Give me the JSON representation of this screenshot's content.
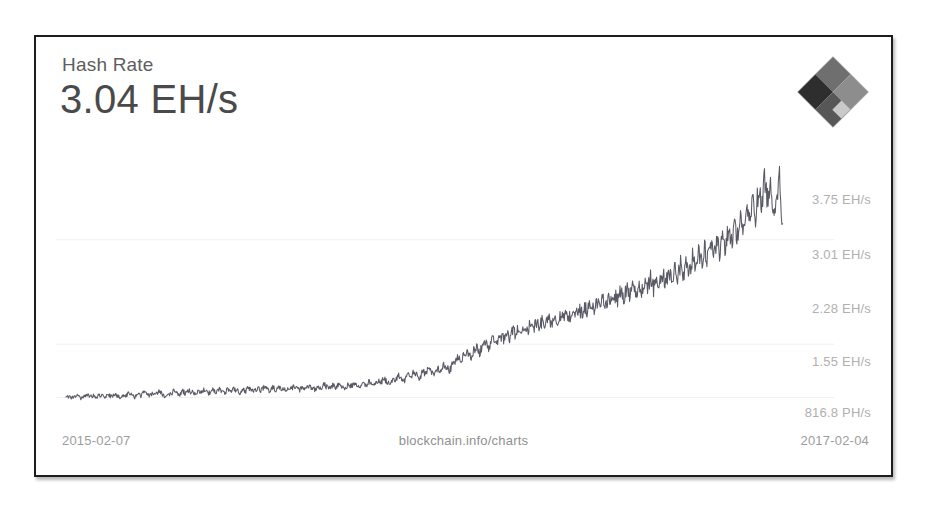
{
  "card": {
    "title": "Hash Rate",
    "value": "3.04 EH/s",
    "logo_icon": "blockchain-diamond-logo-icon",
    "border_color": "#1d1d1d",
    "background": "#ffffff"
  },
  "axis": {
    "y_labels": [
      {
        "text": "3.75 EH/s",
        "y_px": 51
      },
      {
        "text": "3.01 EH/s",
        "y_px": 106
      },
      {
        "text": "2.28 EH/s",
        "y_px": 160
      },
      {
        "text": "1.55 EH/s",
        "y_px": 213
      },
      {
        "text": "816.8 PH/s",
        "y_px": 264
      }
    ],
    "y_label_color": "#b0b0b0",
    "gridline_color": "#f0f0f0",
    "gridlines_y_px": [
      92,
      198,
      252,
      306
    ]
  },
  "footer": {
    "date_start": "2015-02-07",
    "source": "blockchain.info/charts",
    "date_end": "2017-02-04",
    "text_color": "#9d9d9d"
  },
  "chart_data": {
    "type": "line",
    "title": "Hash Rate",
    "xlabel": "",
    "ylabel": "Hash Rate",
    "grid": true,
    "legend": null,
    "line_color": "#5a5a66",
    "x_range": [
      "2015-02-07",
      "2017-02-04"
    ],
    "ylim": [
      0,
      4.12
    ],
    "y_unit": "EH/s",
    "y_tick_values": [
      3.75,
      3.01,
      2.28,
      1.55,
      0.8168
    ],
    "y_tick_labels": [
      "3.75 EH/s",
      "3.01 EH/s",
      "2.28 EH/s",
      "1.55 EH/s",
      "816.8 PH/s"
    ],
    "current_value": 3.04,
    "current_value_label": "3.04 EH/s",
    "values": [
      0.31,
      0.33,
      0.3,
      0.34,
      0.32,
      0.29,
      0.33,
      0.35,
      0.31,
      0.34,
      0.3,
      0.36,
      0.33,
      0.31,
      0.35,
      0.32,
      0.37,
      0.34,
      0.31,
      0.36,
      0.33,
      0.38,
      0.35,
      0.32,
      0.37,
      0.34,
      0.39,
      0.36,
      0.33,
      0.38,
      0.35,
      0.4,
      0.37,
      0.34,
      0.39,
      0.36,
      0.41,
      0.38,
      0.35,
      0.4,
      0.37,
      0.42,
      0.39,
      0.36,
      0.41,
      0.38,
      0.43,
      0.4,
      0.37,
      0.42,
      0.39,
      0.44,
      0.41,
      0.38,
      0.43,
      0.4,
      0.45,
      0.42,
      0.39,
      0.44,
      0.41,
      0.46,
      0.43,
      0.4,
      0.45,
      0.42,
      0.47,
      0.44,
      0.41,
      0.46,
      0.43,
      0.48,
      0.45,
      0.42,
      0.47,
      0.44,
      0.49,
      0.46,
      0.43,
      0.48,
      0.45,
      0.5,
      0.47,
      0.44,
      0.49,
      0.46,
      0.51,
      0.48,
      0.45,
      0.5,
      0.47,
      0.52,
      0.49,
      0.46,
      0.51,
      0.48,
      0.53,
      0.5,
      0.47,
      0.52,
      0.5,
      0.56,
      0.53,
      0.49,
      0.57,
      0.54,
      0.6,
      0.56,
      0.52,
      0.61,
      0.58,
      0.65,
      0.61,
      0.57,
      0.66,
      0.63,
      0.7,
      0.66,
      0.61,
      0.71,
      0.68,
      0.76,
      0.72,
      0.66,
      0.78,
      0.74,
      0.83,
      0.78,
      0.72,
      0.85,
      0.88,
      0.95,
      0.9,
      0.98,
      1.02,
      0.94,
      1.05,
      1.1,
      1.01,
      1.12,
      1.18,
      1.09,
      1.2,
      1.26,
      1.15,
      1.28,
      1.22,
      1.33,
      1.25,
      1.36,
      1.3,
      1.41,
      1.33,
      1.44,
      1.36,
      1.47,
      1.39,
      1.5,
      1.42,
      1.53,
      1.45,
      1.56,
      1.48,
      1.59,
      1.5,
      1.62,
      1.53,
      1.65,
      1.56,
      1.68,
      1.6,
      1.72,
      1.63,
      1.75,
      1.66,
      1.79,
      1.69,
      1.82,
      1.72,
      1.86,
      1.75,
      1.9,
      1.78,
      1.94,
      1.81,
      1.98,
      1.85,
      2.02,
      1.88,
      2.06,
      1.92,
      2.1,
      1.95,
      2.14,
      1.99,
      2.18,
      2.02,
      2.22,
      2.06,
      2.26,
      2.1,
      2.31,
      2.14,
      2.36,
      2.19,
      2.41,
      2.24,
      2.46,
      2.28,
      2.52,
      2.34,
      2.58,
      2.4,
      2.64,
      2.46,
      2.71,
      2.52,
      2.78,
      2.59,
      2.86,
      2.66,
      2.95,
      2.74,
      3.05,
      2.83,
      3.16,
      2.93,
      3.28,
      3.04,
      3.42,
      3.16,
      3.58,
      3.3,
      3.75,
      3.45,
      3.62,
      3.28,
      3.5,
      3.72,
      3.04
    ],
    "annotations": []
  }
}
